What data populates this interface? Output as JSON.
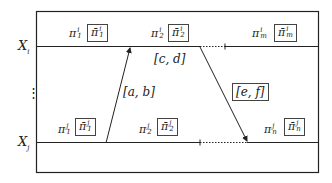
{
  "diagram": {
    "type": "timeline-message-diagram",
    "rows": [
      {
        "id": "Xi",
        "label": "X_i",
        "label_main": "X",
        "label_sub": "i",
        "segments": [
          {
            "plain": "π",
            "sup": "i",
            "sub": "1",
            "boxed_main": "π̄",
            "boxed_sup": "i",
            "boxed_sub": "1"
          },
          {
            "plain": "π",
            "sup": "i",
            "sub": "2",
            "boxed_main": "π̄",
            "boxed_sup": "i",
            "boxed_sub": "2"
          },
          {
            "plain": "π",
            "sup": "i",
            "sub": "m",
            "boxed_main": "π̄",
            "boxed_sup": "i",
            "boxed_sub": "m"
          }
        ]
      },
      {
        "id": "Xj",
        "label": "X_j",
        "label_main": "X",
        "label_sub": "j",
        "segments": [
          {
            "plain": "π",
            "sup": "j",
            "sub": "1",
            "boxed_main": "π̄",
            "boxed_sup": "j",
            "boxed_sub": "1"
          },
          {
            "plain": "π",
            "sup": "j",
            "sub": "2",
            "boxed_main": "π̄",
            "boxed_sup": "j",
            "boxed_sub": "2"
          },
          {
            "plain": "π",
            "sup": "j",
            "sub": "n",
            "boxed_main": "π̄",
            "boxed_sup": "j",
            "boxed_sub": "n"
          }
        ]
      }
    ],
    "ellipsis": "⋮",
    "messages": [
      {
        "label": "[a, b]",
        "from": "Xj",
        "to": "Xi",
        "boxed": false
      },
      {
        "label": "[c, d]",
        "from": "Xi",
        "to": "Xi",
        "boxed": false
      },
      {
        "label": "[e, f]",
        "from": "Xi",
        "to": "Xj",
        "boxed": true
      }
    ]
  }
}
